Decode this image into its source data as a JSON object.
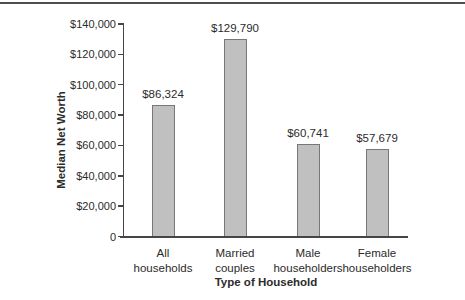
{
  "chart_data": {
    "type": "bar",
    "title": "",
    "xlabel": "Type of Household",
    "ylabel": "Median Net Worth",
    "categories": [
      "All households",
      "Married couples",
      "Male householders",
      "Female householders"
    ],
    "category_lines": [
      [
        "All",
        "households"
      ],
      [
        "Married",
        "couples"
      ],
      [
        "Male",
        "householders"
      ],
      [
        "Female",
        "householders"
      ]
    ],
    "values": [
      86324,
      129790,
      60741,
      57679
    ],
    "value_labels": [
      "$86,324",
      "$129,790",
      "$60,741",
      "$57,679"
    ],
    "ylim": [
      0,
      140000
    ],
    "y_ticks": [
      {
        "value": 0,
        "label": "0"
      },
      {
        "value": 20000,
        "label": "$20,000"
      },
      {
        "value": 40000,
        "label": "$40,000"
      },
      {
        "value": 60000,
        "label": "$60,000"
      },
      {
        "value": 80000,
        "label": "$80,000"
      },
      {
        "value": 100000,
        "label": "$100,000"
      },
      {
        "value": 120000,
        "label": "$120,000"
      },
      {
        "value": 140000,
        "label": "$140,000"
      }
    ],
    "grid": false,
    "legend": null,
    "colors": {
      "bar_fill": "#c0c0c0",
      "bar_border": "#777777",
      "axis": "#454545",
      "text": "#2b2b2b",
      "top_rule": "#4f4f4f",
      "background": "#ffffff"
    }
  }
}
